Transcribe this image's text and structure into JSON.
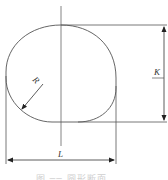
{
  "diagram": {
    "type": "engineering-section-drawing",
    "labels": {
      "radius": "R",
      "height": "K",
      "width": "L"
    },
    "caption": "图 ── 圆形断面",
    "colors": {
      "line": "#555555",
      "background": "#ffffff",
      "caption": "#cfcfcf"
    }
  }
}
